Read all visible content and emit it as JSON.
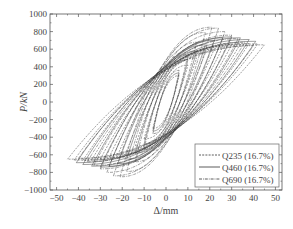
{
  "chart_data": {
    "type": "line",
    "title": "",
    "xlabel": "Δ/mm",
    "ylabel": "P/kN",
    "xlim": [
      -53,
      53
    ],
    "ylim": [
      -1000,
      1000
    ],
    "xticks": [
      -50,
      -40,
      -30,
      -20,
      -10,
      0,
      10,
      20,
      30,
      40,
      50
    ],
    "yticks": [
      1000,
      800,
      600,
      400,
      200,
      0,
      -200,
      -400,
      -600,
      -800,
      -1000
    ],
    "grid": false,
    "legend_position": "lower right",
    "series": [
      {
        "name": "Q235 (16.7%)",
        "style": "dashed",
        "cycle_displacements": [
          6,
          10,
          14,
          18,
          22,
          26,
          30,
          34,
          38,
          42,
          45
        ],
        "cycle_peak_loads": [
          300,
          420,
          500,
          560,
          600,
          630,
          650,
          660,
          665,
          660,
          650
        ]
      },
      {
        "name": "Q460 (16.7%)",
        "style": "solid",
        "cycle_displacements": [
          6,
          10,
          14,
          18,
          22,
          26,
          30,
          34,
          38,
          41
        ],
        "cycle_peak_loads": [
          330,
          480,
          580,
          650,
          700,
          730,
          740,
          730,
          710,
          690
        ]
      },
      {
        "name": "Q690 (16.7%)",
        "style": "dashdot",
        "cycle_displacements": [
          6,
          10,
          14,
          18,
          21,
          24,
          27,
          30,
          33,
          36,
          40
        ],
        "cycle_peak_loads": [
          360,
          540,
          680,
          790,
          850,
          840,
          800,
          760,
          720,
          680,
          640
        ]
      }
    ]
  }
}
